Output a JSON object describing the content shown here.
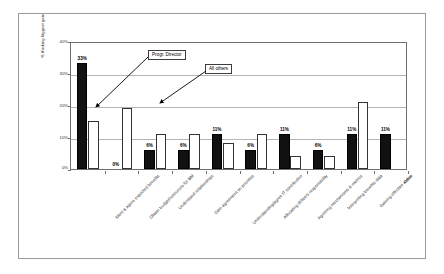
{
  "figure": {
    "y_axis_title": "% thinking biggest gain",
    "y_ticks": [
      "40%",
      "30%",
      "20%",
      "10%",
      "0%"
    ],
    "callouts": {
      "series_a": "Progr. Director",
      "series_b": "All others"
    }
  },
  "chart_data": {
    "type": "bar",
    "title": "",
    "xlabel": "",
    "ylabel": "% thinking biggest gain",
    "ylim": [
      0,
      40
    ],
    "ytick_values": [
      0,
      10,
      20,
      30,
      40
    ],
    "ytick_labels": [
      "0%",
      "10%",
      "20%",
      "30%",
      "40%"
    ],
    "grid": true,
    "legend_position": "annotated-callouts",
    "categories": [
      "Ident & agree expected benefits",
      "Obtain budget/resources for BM",
      "Understand relationships",
      "Gain agreement on priorities",
      "Understanding/agree IT contribution",
      "Allocating delivery responsibility",
      "Agreeing mechanisms & metrics",
      "Interpreting benefits data",
      "Gaining effective action",
      "Other"
    ],
    "series": [
      {
        "name": "Progr. Director",
        "color": "#111111",
        "values": [
          33,
          0,
          6,
          6,
          11,
          6,
          11,
          6,
          11,
          11
        ],
        "value_labels": [
          "33%",
          "0%",
          "6%",
          "6%",
          "11%",
          "6%",
          "11%",
          "6%",
          "11%",
          "11%"
        ]
      },
      {
        "name": "All others",
        "color": "#ffffff",
        "values": [
          15,
          19,
          11,
          11,
          8,
          11,
          4,
          4,
          21,
          0
        ],
        "value_labels": [
          "",
          "",
          "",
          "",
          "",
          "",
          "",
          "",
          "",
          ""
        ]
      }
    ]
  }
}
